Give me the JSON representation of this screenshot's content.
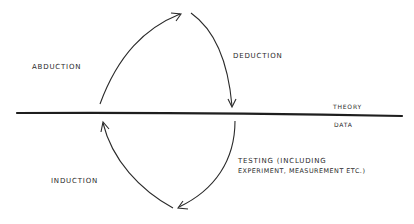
{
  "diagram": {
    "labels": {
      "abduction": "ABDUCTION",
      "deduction": "DEDUCTION",
      "theory": "THEORY",
      "data": "DATA",
      "induction": "INDUCTION",
      "testing_line1": "TESTING (INCLUDING",
      "testing_line2": "EXPERIMENT, MEASUREMENT ETC.)"
    },
    "colors": {
      "ink": "#2a2a2a",
      "background": "#ffffff"
    }
  }
}
